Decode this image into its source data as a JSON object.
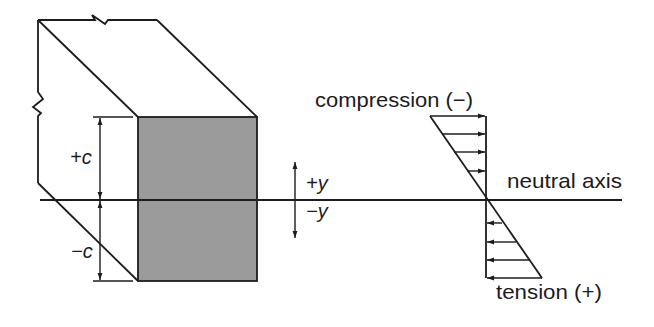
{
  "diagram": {
    "colors": {
      "line": "#1c1c1c",
      "section_fill": "#9b9b9b",
      "background": "#ffffff"
    },
    "labels": {
      "plus_c": "+c",
      "minus_c": "−c",
      "plus_y": "+y",
      "minus_y": "−y",
      "compression": "compression (−)",
      "neutral_axis": "neutral axis",
      "tension": "tension (+)"
    },
    "stress_arrows": {
      "compression_count": 4,
      "tension_count": 4
    }
  }
}
